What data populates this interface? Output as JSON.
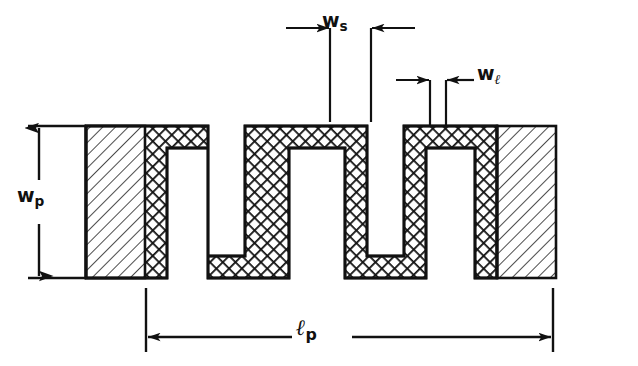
{
  "figure": {
    "background_color": "#ffffff",
    "ink_color": "#111111"
  },
  "labels": {
    "w_s": {
      "base": "w",
      "sub": "s",
      "name": "spacing-width-label"
    },
    "w_l": {
      "base": "w",
      "sub": "ℓ",
      "name": "line-width-label"
    },
    "w_p": {
      "base": "w",
      "sub": "p",
      "name": "pattern-width-label"
    },
    "l_p": {
      "base": "ℓ",
      "sub": "p",
      "name": "pattern-length-label"
    }
  },
  "geometry": {
    "units": "px",
    "strip": {
      "fill_pattern": "crosshatch",
      "wall_thickness": 22,
      "top_y": 126,
      "bottom_y": 278,
      "left_x": 86,
      "right_x": 556
    },
    "end_pads": {
      "fill_pattern": "diagonal-hatch",
      "left": {
        "x": 86,
        "width": 59
      },
      "right": {
        "x": 497,
        "width": 59
      }
    },
    "teeth_count": 4
  },
  "dimensions": [
    {
      "id": "w_s",
      "orientation": "horizontal",
      "from_x": 330,
      "to_x": 371,
      "line_y": 28,
      "arrow_style": "outward",
      "extension_bottom_y": 122
    },
    {
      "id": "w_l",
      "orientation": "horizontal",
      "from_x": 430,
      "to_x": 446,
      "line_y": 80,
      "arrow_style": "outward",
      "extension_bottom_y": 126
    },
    {
      "id": "w_p",
      "orientation": "vertical",
      "from_y": 126,
      "to_y": 278,
      "line_x": 58,
      "arrow_style": "inward"
    },
    {
      "id": "l_p",
      "orientation": "horizontal",
      "from_x": 146,
      "to_x": 553,
      "line_y": 337,
      "arrow_style": "inward"
    }
  ]
}
